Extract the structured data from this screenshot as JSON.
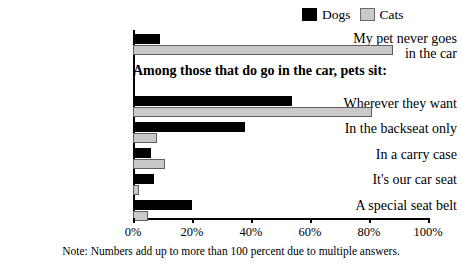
{
  "chart_data": {
    "type": "bar",
    "orientation": "horizontal",
    "title": "",
    "subtitle": "Among those that do go in the car, pets sit:",
    "xlabel": "",
    "ylabel": "",
    "xlim": [
      0,
      100
    ],
    "xticks": [
      0,
      20,
      40,
      60,
      80,
      100
    ],
    "xticklabels": [
      "0%",
      "20%",
      "40%",
      "60%",
      "80%",
      "100%"
    ],
    "grid": false,
    "legend_position": "top-right",
    "categories": [
      "My pet never goes\nin the car",
      "Wherever they want",
      "In the backseat only",
      "In a carry case",
      "It's our car seat",
      "A special seat belt"
    ],
    "series": [
      {
        "name": "Dogs",
        "color": "#000000",
        "values": [
          9,
          54,
          38,
          6,
          7,
          20
        ]
      },
      {
        "name": "Cats",
        "color": "#c9c9c9",
        "values": [
          88,
          81,
          8,
          11,
          2,
          5
        ]
      }
    ],
    "annotations": [
      "Note: Numbers add up to more than 100 percent due to multiple answers."
    ]
  },
  "legend": {
    "entries": [
      {
        "label": "Dogs",
        "swatch": "black-square-icon"
      },
      {
        "label": "Cats",
        "swatch": "gray-square-icon"
      }
    ]
  },
  "footnote": "Note: Numbers add up to more than 100 percent due to multiple answers."
}
